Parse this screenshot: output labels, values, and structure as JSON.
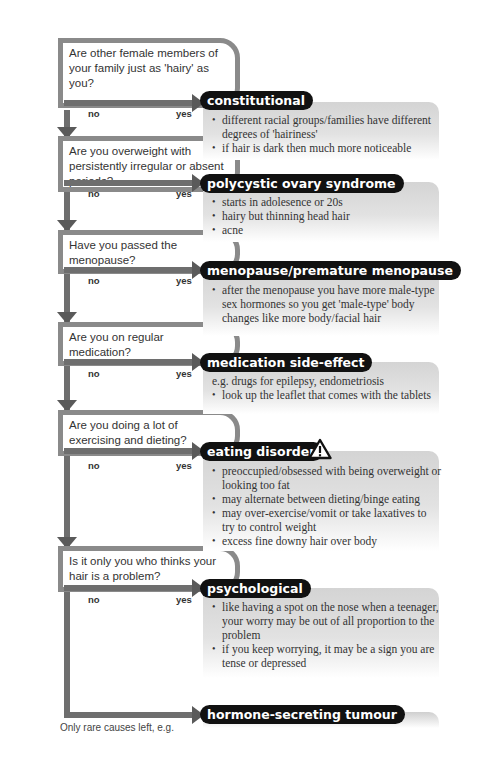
{
  "questions": [
    {
      "text": "Are other female members of your family just as 'hairy' as you?"
    },
    {
      "text": "Are you overweight with persistently irregular or absent periods?"
    },
    {
      "text": "Have you passed the menopause?"
    },
    {
      "text": "Are you on regular medication?"
    },
    {
      "text": "Are you doing a lot of exercising and dieting?"
    },
    {
      "text": "Is it only you who thinks your hair is a problem?"
    }
  ],
  "labels": {
    "no": "no",
    "yes": "yes"
  },
  "outcomes": [
    {
      "title": "constitutional",
      "intro": "",
      "bullets": [
        "different racial groups/families have different degrees of 'hairiness'",
        "if hair is dark then much more noticeable"
      ]
    },
    {
      "title": "polycystic ovary syndrome",
      "intro": "",
      "bullets": [
        "starts in adolesence or 20s",
        "hairy but thinning head hair",
        "acne"
      ]
    },
    {
      "title": "menopause/premature menopause",
      "intro": "",
      "bullets": [
        "after the menopause you have more male-type sex hormones so you get 'male-type' body changes like more body/facial  hair"
      ]
    },
    {
      "title": "medication side-effect",
      "intro": "e.g. drugs for epilepsy, endometriosis",
      "bullets": [
        "look up the leaflet that comes with the tablets"
      ]
    },
    {
      "title": "eating disorder",
      "intro": "",
      "warning_icon": "warning-triangle-icon",
      "bullets": [
        "preoccupied/obsessed with being overweight or looking too fat",
        "may alternate between dieting/binge eating",
        "may over-exercise/vomit or take laxatives to try to control weight",
        "excess fine downy hair over body"
      ]
    },
    {
      "title": "psychological",
      "intro": "",
      "bullets": [
        "like having a spot on the nose when a teenager, your worry may be out of all proportion to the problem",
        "if you keep worrying, it may be a sign you are tense or depressed"
      ]
    },
    {
      "title": "hormone-secreting tumour",
      "intro": "",
      "bullets": []
    }
  ],
  "footnote": "Only rare causes left, e.g.",
  "colors": {
    "connector": "#6e6e6e",
    "pill": "#111111",
    "panel": "#d4d4d4"
  }
}
